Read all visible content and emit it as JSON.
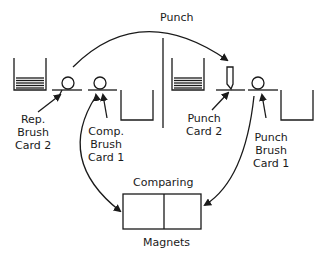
{
  "diagram": {
    "type": "card punch / comparing flow",
    "labels": {
      "punch_arc": "Punch",
      "rep_brush_card2": "Rep.\nBrush\nCard 2",
      "comp_brush_card1": "Comp.\nBrush\nCard 1",
      "punch_card2": "Punch\nCard 2",
      "punch_brush_card1": "Punch\nBrush\nCard 1",
      "comparing": "Comparing",
      "magnets": "Magnets"
    },
    "nodes": [
      {
        "id": "left-hopper",
        "kind": "card hopper (stacked)"
      },
      {
        "id": "rep-brush",
        "kind": "brush roller"
      },
      {
        "id": "comp-brush",
        "kind": "brush roller"
      },
      {
        "id": "left-stacker",
        "kind": "empty stacker"
      },
      {
        "id": "right-hopper",
        "kind": "card hopper (stacked)"
      },
      {
        "id": "punch-die",
        "kind": "punch"
      },
      {
        "id": "punch-brush",
        "kind": "brush roller"
      },
      {
        "id": "right-stacker",
        "kind": "empty stacker"
      },
      {
        "id": "comparing-magnets",
        "kind": "two-cell box"
      }
    ],
    "edges": [
      {
        "from": "rep-brush",
        "to": "punch-die",
        "label": "Punch"
      },
      {
        "from": "comp-brush",
        "to": "comparing-magnets"
      },
      {
        "from": "punch-brush",
        "to": "comparing-magnets"
      }
    ],
    "colors": {
      "ink": "#1a1a1a",
      "background": "#ffffff"
    }
  }
}
